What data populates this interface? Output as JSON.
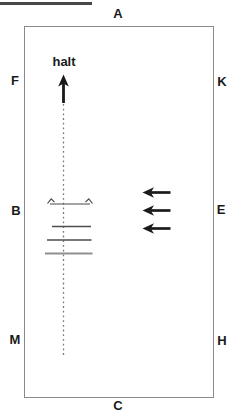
{
  "diagram": {
    "kind": "dressage-arena-schematic",
    "markers": [
      {
        "id": "A",
        "label": "A"
      },
      {
        "id": "F",
        "label": "F"
      },
      {
        "id": "K",
        "label": "K"
      },
      {
        "id": "B",
        "label": "B"
      },
      {
        "id": "E",
        "label": "E"
      },
      {
        "id": "M",
        "label": "M"
      },
      {
        "id": "H",
        "label": "H"
      },
      {
        "id": "C",
        "label": "C"
      }
    ],
    "annotations": {
      "halt": "halt"
    },
    "symbols": [
      "halt-up-arrow-icon",
      "center-dotted-line",
      "spread-tick-symbol",
      "ground-pole",
      "ground-pole",
      "ground-pole",
      "left-arrow-icon",
      "left-arrow-icon",
      "left-arrow-icon"
    ],
    "colors": {
      "ink": "#1a1a1a",
      "arena_border": "#8a8a8a",
      "pole_dark": "#4d4d4d",
      "pole_light": "#8f8f8f",
      "dotted_line": "#7a7a7a",
      "underline": "#474747"
    }
  }
}
